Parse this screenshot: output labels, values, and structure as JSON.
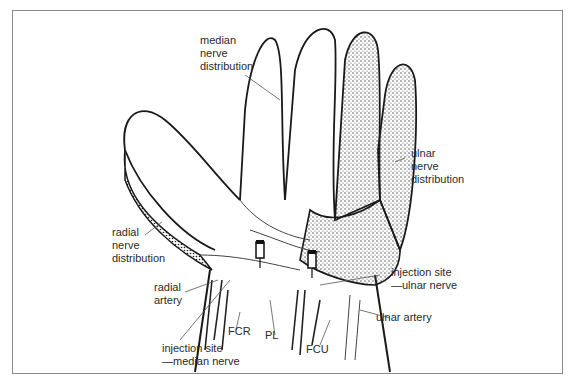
{
  "figure": {
    "labels": {
      "median_nerve": "median\nnerve\ndistribution",
      "ulnar_nerve": "ulnar\nnerve\ndistribution",
      "radial_nerve": "radial\nnerve\ndistribution",
      "radial_artery": "radial\nartery",
      "injection_ulnar": "injection site\n—ulnar nerve",
      "ulnar_artery": "ulnar artery",
      "fcr": "FCR",
      "pl": "PL",
      "fcu": "FCU",
      "injection_median": "injection site\n—median nerve"
    },
    "colors": {
      "frame": "#8a8a8a",
      "line": "#1a1a1a",
      "text": "#2a2a2a",
      "stipple": "#333333"
    }
  }
}
